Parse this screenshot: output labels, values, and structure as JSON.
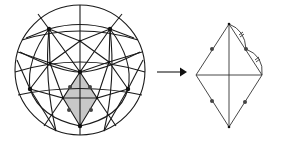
{
  "figure": {
    "colors": {
      "stroke": "#1a1a1a",
      "shade": "#c8c8c8",
      "background": "#ffffff",
      "dot": "#444444"
    },
    "sphere": {
      "center": [
        80,
        70
      ],
      "radius": 65,
      "vertices": {
        "top_left": [
          49,
          29
        ],
        "top_right": [
          110,
          29
        ],
        "upper_center": [
          80,
          41
        ],
        "inner_left": [
          50,
          63
        ],
        "inner_right": [
          109,
          62
        ],
        "center": [
          80,
          72
        ],
        "left": [
          30,
          89
        ],
        "right": [
          128,
          89
        ],
        "bottom": [
          80,
          126
        ],
        "shade_left": [
          63,
          98
        ],
        "shade_right": [
          97,
          98
        ]
      },
      "shaded_face_midpoint_dots": [
        [
          70,
          87
        ],
        [
          90,
          87
        ],
        [
          69,
          110
        ],
        [
          91,
          110
        ]
      ]
    },
    "arrow": {
      "from": [
        157,
        72
      ],
      "to": [
        186,
        72
      ],
      "label": ""
    },
    "flat_rhombus": {
      "top": [
        229,
        24
      ],
      "left": [
        196,
        75
      ],
      "right": [
        262,
        75
      ],
      "bottom": [
        229,
        127
      ],
      "edge_midpoint_dots": [
        [
          212,
          49
        ],
        [
          246,
          49
        ],
        [
          212,
          101
        ],
        [
          245,
          102
        ]
      ],
      "arc_tick_marks": 2
    }
  }
}
